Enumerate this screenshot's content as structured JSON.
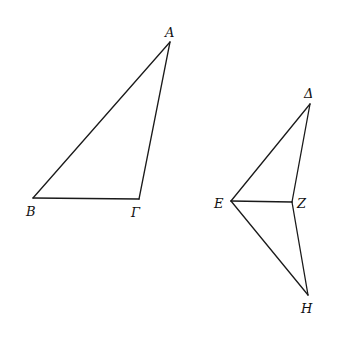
{
  "figure": {
    "width": 340,
    "height": 347,
    "line_color": "#1a1a1a",
    "background": "#ffffff"
  },
  "triangle_1": {
    "name": "ABΓ",
    "vertices": {
      "A": {
        "label": "A",
        "x": 170,
        "y": 42
      },
      "B": {
        "label": "B",
        "x": 33,
        "y": 198
      },
      "Γ": {
        "label": "Γ",
        "x": 139,
        "y": 199
      }
    },
    "edges": [
      "AB",
      "AΓ",
      "BΓ"
    ]
  },
  "figure_2": {
    "name": "ΔEZH",
    "vertices": {
      "Δ": {
        "label": "Δ",
        "x": 310,
        "y": 104
      },
      "E": {
        "label": "E",
        "x": 231,
        "y": 201
      },
      "Z": {
        "label": "Z",
        "x": 292,
        "y": 202
      },
      "H": {
        "label": "H",
        "x": 308,
        "y": 295
      }
    },
    "edges": [
      "ΔE",
      "ΔZ",
      "EZ",
      "EH",
      "ZH"
    ]
  },
  "labels": {
    "A": "A",
    "B": "B",
    "Gamma": "Γ",
    "Delta": "Δ",
    "E": "E",
    "Z": "Z",
    "H": "H"
  }
}
